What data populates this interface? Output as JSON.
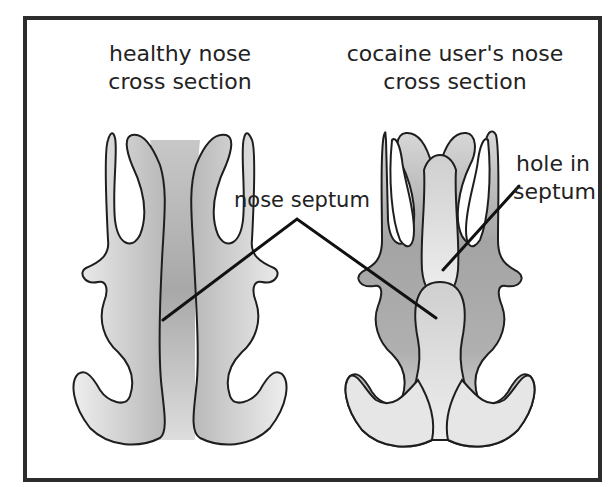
{
  "diagram": {
    "panels": [
      {
        "title_line1": "healthy nose",
        "title_line2": "cross section"
      },
      {
        "title_line1": "cocaine user's nose",
        "title_line2": "cross section"
      }
    ],
    "labels": {
      "septum": "nose septum",
      "hole_line1": "hole in",
      "hole_line2": "septum"
    },
    "colors": {
      "frame": "#2d2d2d",
      "outline": "#1e1e1e",
      "light_fill": "#e6e6e6",
      "dark_fill": "#a6a6a6",
      "text": "#222222"
    }
  }
}
